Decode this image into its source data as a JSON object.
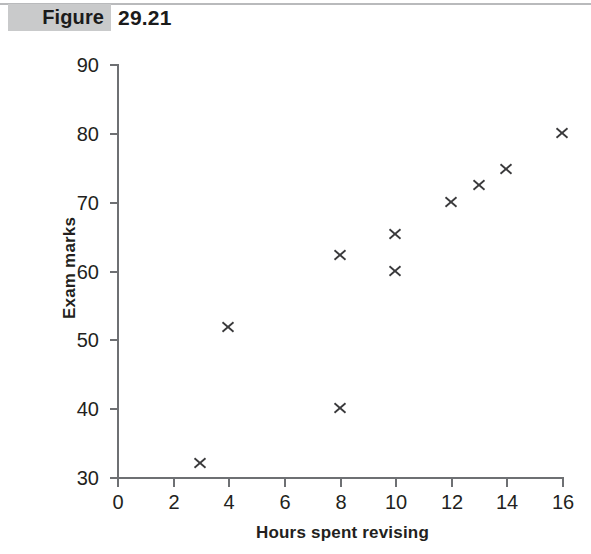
{
  "header": {
    "figure_tag": "Figure",
    "figure_number": "29.21",
    "tag_bg_color": "#c9cacb",
    "rule_color": "#b9babc"
  },
  "chart_data": {
    "type": "scatter",
    "title": "",
    "xlabel": "Hours spent revising",
    "ylabel": "Exam marks",
    "xlim": [
      0,
      16
    ],
    "ylim": [
      30,
      90
    ],
    "xticks": [
      0,
      2,
      4,
      6,
      8,
      10,
      12,
      14,
      16
    ],
    "xtick_labels": [
      "0",
      "2",
      "4",
      "6",
      "8",
      "10",
      "12",
      "14",
      "16"
    ],
    "yticks": [
      30,
      40,
      50,
      60,
      70,
      80,
      90
    ],
    "ytick_labels": [
      "30",
      "40",
      "50",
      "60",
      "70",
      "80",
      "90"
    ],
    "grid": false,
    "legend": null,
    "marker": "x",
    "marker_color": "#3a3a3c",
    "axis_color": "#6e7073",
    "points": [
      {
        "x": 3,
        "y": 32
      },
      {
        "x": 4,
        "y": 51.8
      },
      {
        "x": 8,
        "y": 62.3
      },
      {
        "x": 8,
        "y": 40
      },
      {
        "x": 10,
        "y": 65.3
      },
      {
        "x": 10,
        "y": 60
      },
      {
        "x": 12,
        "y": 70
      },
      {
        "x": 13,
        "y": 72.4
      },
      {
        "x": 14,
        "y": 74.7
      },
      {
        "x": 16,
        "y": 80
      }
    ]
  }
}
